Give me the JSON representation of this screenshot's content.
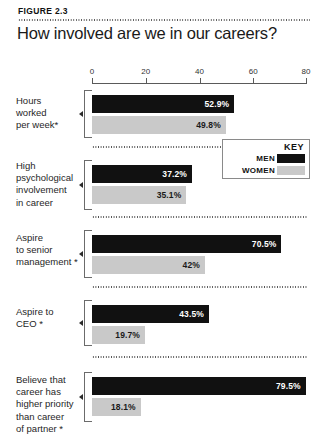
{
  "figure": {
    "label": "FIGURE 2.3",
    "title": "How involved are we in our careers?"
  },
  "legend": {
    "title": "KEY",
    "entries": [
      {
        "label": "MEN",
        "color": "#111111"
      },
      {
        "label": "WOMEN",
        "color": "#c9c9c9"
      }
    ]
  },
  "chart_data": {
    "type": "bar",
    "orientation": "horizontal",
    "title": "How involved are we in our careers?",
    "xlabel": "",
    "ylabel": "",
    "xlim": [
      0,
      80
    ],
    "xticks": [
      0,
      20,
      40,
      60,
      80
    ],
    "xtick_labels": [
      "0",
      "20",
      "40",
      "60",
      "80"
    ],
    "grid": false,
    "legend_position": "upper-right-inset",
    "categories": [
      "Hours worked per week*",
      "High psychological involvement in career",
      "Aspire to senior management *",
      "Aspire to CEO *",
      "Believe that career has higher priority than career of partner *"
    ],
    "series": [
      {
        "name": "MEN",
        "color": "#111111",
        "values": [
          52.9,
          37.2,
          70.5,
          43.5,
          79.5
        ],
        "value_labels": [
          "52.9%",
          "37.2%",
          "70.5%",
          "43.5%",
          "79.5%"
        ]
      },
      {
        "name": "WOMEN",
        "color": "#c9c9c9",
        "values": [
          49.8,
          35.1,
          42,
          19.7,
          18.1
        ],
        "value_labels": [
          "49.8%",
          "35.1%",
          "42%",
          "19.7%",
          "18.1%"
        ]
      }
    ]
  },
  "groups": [
    {
      "label_lines": [
        "Hours",
        "worked",
        "per week*"
      ],
      "men_label": "52.9%",
      "women_label": "49.8%"
    },
    {
      "label_lines": [
        "High",
        "psychological",
        "involvement",
        "in career"
      ],
      "men_label": "37.2%",
      "women_label": "35.1%"
    },
    {
      "label_lines": [
        "Aspire",
        "to senior",
        "management *"
      ],
      "men_label": "70.5%",
      "women_label": "42%"
    },
    {
      "label_lines": [
        "Aspire to",
        "CEO *"
      ],
      "men_label": "43.5%",
      "women_label": "19.7%"
    },
    {
      "label_lines": [
        "Believe that",
        "career has",
        "higher priority",
        "than career",
        "of partner *"
      ],
      "men_label": "79.5%",
      "women_label": "18.1%"
    }
  ]
}
